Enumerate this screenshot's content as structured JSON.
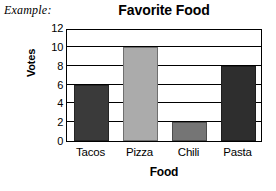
{
  "example_label": "Example:",
  "chart_data": {
    "type": "bar",
    "title": "Favorite Food",
    "xlabel": "Food",
    "ylabel": "Votes",
    "categories": [
      "Tacos",
      "Pizza",
      "Chili",
      "Pasta"
    ],
    "values": [
      6,
      10,
      2,
      8
    ],
    "bar_colors": [
      "#3a3a3a",
      "#ababab",
      "#757575",
      "#2e2e2e"
    ],
    "ylim": [
      0,
      12
    ],
    "ytick_step": 2,
    "ytick_labels": [
      "12",
      "10",
      "8",
      "6",
      "4",
      "2",
      "0"
    ],
    "grid": "horizontal",
    "legend": "none"
  }
}
